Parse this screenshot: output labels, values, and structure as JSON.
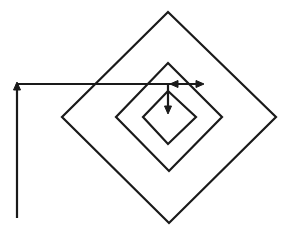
{
  "diagram": {
    "background": "#ffffff",
    "stroke_color": "#1a1a1a",
    "stroke_width": 2.2,
    "diamonds": [
      {
        "name": "outer",
        "top": [
          168,
          12
        ],
        "right": [
          276,
          117
        ],
        "bottom": [
          169,
          223
        ],
        "left": [
          62,
          117
        ]
      },
      {
        "name": "middle",
        "top": [
          168,
          63
        ],
        "right": [
          222,
          117
        ],
        "bottom": [
          169,
          171
        ],
        "left": [
          116,
          117
        ]
      },
      {
        "name": "inner",
        "top": [
          168,
          91
        ],
        "right": [
          196,
          117
        ],
        "bottom": [
          168,
          144
        ],
        "left": [
          143,
          117
        ]
      }
    ],
    "path": {
      "vertical_line": {
        "x": 17,
        "y_bottom": 218,
        "y_top": 84
      },
      "horizontal_line": {
        "y": 84,
        "x_start": 17,
        "x_end": 204
      },
      "down_line": {
        "x": 168,
        "y_start": 84,
        "y_end": 113
      }
    },
    "arrowheads": [
      {
        "name": "up-arrowhead",
        "at": [
          17,
          84
        ],
        "direction": "up"
      },
      {
        "name": "left-arrowhead",
        "at": [
          170,
          84
        ],
        "direction": "left"
      },
      {
        "name": "right-arrowhead",
        "at": [
          204,
          84
        ],
        "direction": "right"
      },
      {
        "name": "down-arrowhead",
        "at": [
          168,
          114
        ],
        "direction": "down"
      }
    ]
  }
}
